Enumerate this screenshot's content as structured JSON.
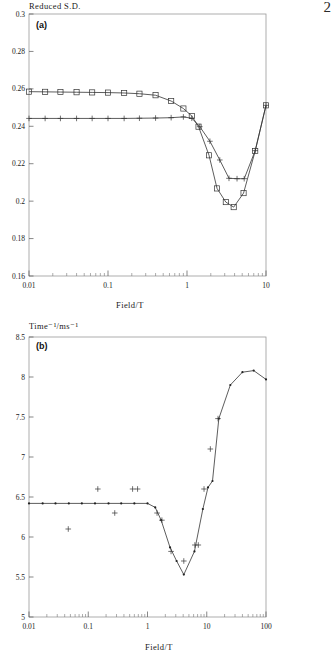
{
  "page": {
    "number": "2"
  },
  "figures": [
    {
      "tag": "(a)",
      "y_axis_title": "Reduced S.D.",
      "x_axis_title": "Field/T",
      "x_ticks": [
        "0.01",
        "0.1",
        "1",
        "10"
      ],
      "y_ticks": [
        "0.16",
        "0.18",
        "0.2",
        "0.22",
        "0.24",
        "0.26",
        "0.28",
        "0.3"
      ]
    },
    {
      "tag": "(b)",
      "y_axis_title": "Time⁻¹/ms⁻¹",
      "x_axis_title": "Field/T",
      "x_ticks": [
        "0.01",
        "0.1",
        "1",
        "10",
        "100"
      ],
      "y_ticks": [
        "5",
        "5.5",
        "6",
        "6.5",
        "7",
        "7.5",
        "8",
        "8.5"
      ]
    }
  ],
  "chart_data": [
    {
      "type": "line",
      "title": "",
      "panel": "(a)",
      "xlabel": "Field/T",
      "ylabel": "Reduced S.D.",
      "xscale": "log",
      "xlim": [
        0.01,
        10
      ],
      "ylim": [
        0.16,
        0.3
      ],
      "grid": false,
      "legend": "none",
      "series": [
        {
          "name": "squares",
          "marker": "square",
          "x": [
            0.01,
            0.016,
            0.025,
            0.04,
            0.063,
            0.1,
            0.16,
            0.25,
            0.4,
            0.63,
            0.9,
            1.15,
            1.4,
            1.9,
            2.4,
            3.1,
            3.9,
            5.2,
            7.3,
            10.0
          ],
          "y": [
            0.2585,
            0.2584,
            0.2583,
            0.2582,
            0.2581,
            0.258,
            0.2578,
            0.2574,
            0.2566,
            0.2535,
            0.2495,
            0.2455,
            0.2398,
            0.2245,
            0.2068,
            0.1995,
            0.1968,
            0.2043,
            0.2268,
            0.2512
          ]
        },
        {
          "name": "plus",
          "marker": "plus",
          "x": [
            0.01,
            0.016,
            0.025,
            0.04,
            0.063,
            0.1,
            0.16,
            0.25,
            0.4,
            0.63,
            0.9,
            1.15,
            1.45,
            1.95,
            2.6,
            3.4,
            4.3,
            5.3,
            7.3,
            10.0
          ],
          "y": [
            0.2442,
            0.2442,
            0.2442,
            0.2442,
            0.2442,
            0.2442,
            0.2442,
            0.2443,
            0.2444,
            0.2446,
            0.245,
            0.2443,
            0.2398,
            0.232,
            0.222,
            0.2122,
            0.212,
            0.212,
            0.227,
            0.2512
          ]
        }
      ]
    },
    {
      "type": "line",
      "title": "",
      "panel": "(b)",
      "xlabel": "Field/T",
      "ylabel": "Time⁻¹/ms⁻¹",
      "xscale": "log",
      "xlim": [
        0.01,
        100
      ],
      "ylim": [
        5,
        8.5
      ],
      "grid": false,
      "legend": "none",
      "series": [
        {
          "name": "theory-line",
          "marker": "dot",
          "x": [
            0.01,
            0.017,
            0.028,
            0.047,
            0.078,
            0.13,
            0.22,
            0.36,
            0.6,
            1.0,
            1.35,
            1.7,
            2.4,
            3.1,
            4.1,
            6.2,
            8.6,
            10.5,
            12.5,
            16.0,
            25.0,
            40.0,
            62.0,
            100.0
          ],
          "y": [
            6.42,
            6.42,
            6.42,
            6.42,
            6.42,
            6.42,
            6.42,
            6.42,
            6.42,
            6.42,
            6.37,
            6.21,
            5.87,
            5.7,
            5.53,
            5.82,
            6.35,
            6.62,
            6.7,
            7.48,
            7.9,
            8.06,
            8.08,
            7.97
          ]
        },
        {
          "name": "experimental-points",
          "marker": "plus",
          "x": [
            0.046,
            0.145,
            0.28,
            0.56,
            0.68,
            1.45,
            1.75,
            2.5,
            4.1,
            6.3,
            7.2,
            9.0,
            11.5,
            15.5
          ],
          "y": [
            6.1,
            6.6,
            6.3,
            6.6,
            6.6,
            6.3,
            6.21,
            5.82,
            5.7,
            5.9,
            5.9,
            6.6,
            7.1,
            7.48
          ]
        }
      ]
    }
  ]
}
